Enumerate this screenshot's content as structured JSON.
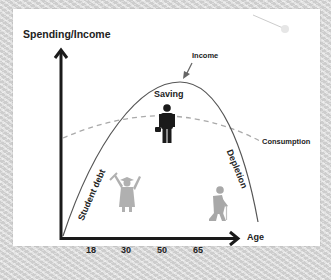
{
  "diagram": {
    "y_axis_label": "Spending/Income",
    "x_axis_label": "Age",
    "x_ticks": [
      "18",
      "30",
      "50",
      "65"
    ],
    "curves": {
      "income_label": "Income",
      "consumption_label": "Consumption"
    },
    "regions": {
      "saving": "Saving",
      "student_debt": "Student debt",
      "depletion": "Depletion"
    },
    "icons": [
      "worker-with-briefcase-icon",
      "graduate-icon",
      "elderly-with-cane-icon"
    ],
    "colors": {
      "axis": "#1a1a1a",
      "income_curve": "#555555",
      "consumption_curve": "#aaaaaa",
      "worker_icon": "#1a1a1a",
      "faded_icons": "#b0b0b0",
      "card": "#ffffff"
    }
  }
}
